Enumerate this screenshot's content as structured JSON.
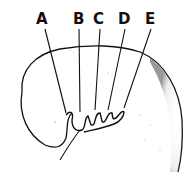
{
  "diagram": {
    "labels": [
      {
        "id": "A",
        "text": "A",
        "x": 36,
        "y": 12
      },
      {
        "id": "B",
        "text": "B",
        "x": 73,
        "y": 12
      },
      {
        "id": "C",
        "text": "C",
        "x": 93,
        "y": 12
      },
      {
        "id": "D",
        "text": "D",
        "x": 118,
        "y": 12
      },
      {
        "id": "E",
        "text": "E",
        "x": 145,
        "y": 12
      }
    ],
    "colors": {
      "ink": "#111111",
      "background": "#ffffff",
      "stipple": "#555555"
    }
  }
}
